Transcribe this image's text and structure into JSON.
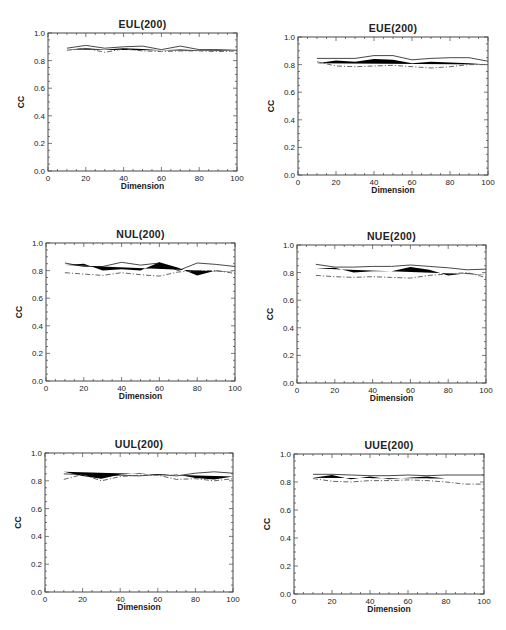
{
  "figure": {
    "panel_count": 6,
    "layout": "3 rows x 2 columns"
  },
  "chart_data": [
    {
      "type": "line",
      "title": "EUL(200)",
      "xlabel": "Dimension",
      "ylabel": "CC",
      "xlim": [
        0,
        100
      ],
      "ylim": [
        0.0,
        1.0
      ],
      "xticks": [
        "0",
        "20",
        "40",
        "60",
        "80",
        "100"
      ],
      "yticks": [
        "0.0",
        "0.2",
        "0.4",
        "0.6",
        "0.8",
        "1.0"
      ],
      "grid": false,
      "legend": null,
      "frame_px": {
        "x0": 48,
        "x1": 237,
        "y_top": 33,
        "y_bottom": 171
      },
      "x": [
        10,
        20,
        30,
        40,
        50,
        60,
        70,
        80,
        90,
        100
      ],
      "series": [
        {
          "name": "solid",
          "style": "solid",
          "values": [
            0.89,
            0.91,
            0.89,
            0.9,
            0.905,
            0.88,
            0.905,
            0.88,
            0.88,
            0.875
          ]
        },
        {
          "name": "dashed",
          "style": "dashed",
          "values": [
            0.88,
            0.89,
            0.88,
            0.89,
            0.885,
            0.875,
            0.88,
            0.875,
            0.875,
            0.87
          ]
        },
        {
          "name": "dash-dot",
          "style": "dashdot",
          "values": [
            0.875,
            0.89,
            0.86,
            0.885,
            0.87,
            0.865,
            0.87,
            0.87,
            0.865,
            0.87
          ]
        }
      ]
    },
    {
      "type": "line",
      "title": "EUE(200)",
      "xlabel": "Dimension",
      "ylabel": "CC",
      "xlim": [
        0,
        100
      ],
      "ylim": [
        0.0,
        1.0
      ],
      "xticks": [
        "0",
        "20",
        "40",
        "60",
        "80",
        "100"
      ],
      "yticks": [
        "0.0",
        "0.2",
        "0.4",
        "0.6",
        "0.8",
        "1.0"
      ],
      "grid": false,
      "legend": null,
      "frame_px": {
        "x0": 298,
        "x1": 488,
        "y_top": 37,
        "y_bottom": 175
      },
      "x": [
        10,
        20,
        30,
        40,
        50,
        60,
        70,
        80,
        90,
        100
      ],
      "series": [
        {
          "name": "solid",
          "style": "solid",
          "values": [
            0.845,
            0.845,
            0.845,
            0.865,
            0.865,
            0.835,
            0.845,
            0.85,
            0.85,
            0.825
          ]
        },
        {
          "name": "dashed",
          "style": "dashed",
          "values": [
            0.81,
            0.83,
            0.82,
            0.84,
            0.835,
            0.81,
            0.82,
            0.815,
            0.81,
            0.8
          ]
        },
        {
          "name": "dash-dot",
          "style": "dashdot",
          "values": [
            0.82,
            0.79,
            0.785,
            0.79,
            0.795,
            0.785,
            0.775,
            0.785,
            0.8,
            0.8
          ]
        }
      ]
    },
    {
      "type": "line",
      "title": "NUL(200)",
      "xlabel": "Dimension",
      "ylabel": "CC",
      "xlim": [
        0,
        100
      ],
      "ylim": [
        0.0,
        1.0
      ],
      "xticks": [
        "0",
        "20",
        "40",
        "60",
        "80",
        "100"
      ],
      "yticks": [
        "0.0",
        "0.2",
        "0.4",
        "0.6",
        "0.8",
        "1.0"
      ],
      "grid": false,
      "legend": null,
      "frame_px": {
        "x0": 46,
        "x1": 235,
        "y_top": 243,
        "y_bottom": 381
      },
      "x": [
        10,
        20,
        30,
        40,
        50,
        60,
        70,
        80,
        90,
        100
      ],
      "series": [
        {
          "name": "solid",
          "style": "solid",
          "values": [
            0.855,
            0.83,
            0.83,
            0.86,
            0.84,
            0.855,
            0.8,
            0.855,
            0.845,
            0.83
          ]
        },
        {
          "name": "dashed",
          "style": "dashed",
          "values": [
            0.84,
            0.85,
            0.8,
            0.81,
            0.8,
            0.86,
            0.82,
            0.765,
            0.8,
            0.79
          ]
        },
        {
          "name": "dash-dot",
          "style": "dashdot",
          "values": [
            0.785,
            0.775,
            0.765,
            0.785,
            0.77,
            0.76,
            0.79,
            0.8,
            0.8,
            0.78
          ]
        }
      ]
    },
    {
      "type": "line",
      "title": "NUE(200)",
      "xlabel": "Dimension",
      "ylabel": "CC",
      "xlim": [
        0,
        100
      ],
      "ylim": [
        0.0,
        1.0
      ],
      "xticks": [
        "0",
        "20",
        "40",
        "60",
        "80",
        "100"
      ],
      "yticks": [
        "0.0",
        "0.2",
        "0.4",
        "0.6",
        "0.8",
        "1.0"
      ],
      "grid": false,
      "legend": null,
      "frame_px": {
        "x0": 297,
        "x1": 486,
        "y_top": 245,
        "y_bottom": 383
      },
      "x": [
        10,
        20,
        30,
        40,
        50,
        60,
        70,
        80,
        90,
        100
      ],
      "series": [
        {
          "name": "solid",
          "style": "solid",
          "values": [
            0.86,
            0.84,
            0.84,
            0.845,
            0.845,
            0.855,
            0.845,
            0.835,
            0.82,
            0.825
          ]
        },
        {
          "name": "dashed",
          "style": "dashed",
          "values": [
            0.83,
            0.835,
            0.8,
            0.81,
            0.81,
            0.84,
            0.82,
            0.78,
            0.795,
            0.785
          ]
        },
        {
          "name": "dash-dot",
          "style": "dashdot",
          "values": [
            0.78,
            0.77,
            0.765,
            0.77,
            0.765,
            0.76,
            0.78,
            0.79,
            0.8,
            0.765
          ]
        }
      ]
    },
    {
      "type": "line",
      "title": "UUL(200)",
      "xlabel": "Dimension",
      "ylabel": "CC",
      "xlim": [
        0,
        100
      ],
      "ylim": [
        0.0,
        1.0
      ],
      "xticks": [
        "0",
        "20",
        "40",
        "60",
        "80",
        "100"
      ],
      "yticks": [
        "0.0",
        "0.2",
        "0.4",
        "0.6",
        "0.8",
        "1.0"
      ],
      "grid": false,
      "legend": null,
      "frame_px": {
        "x0": 45,
        "x1": 233,
        "y_top": 453,
        "y_bottom": 592
      },
      "x": [
        10,
        20,
        30,
        40,
        50,
        60,
        70,
        80,
        90,
        100
      ],
      "series": [
        {
          "name": "solid",
          "style": "solid",
          "values": [
            0.85,
            0.845,
            0.835,
            0.84,
            0.835,
            0.845,
            0.835,
            0.855,
            0.865,
            0.855
          ]
        },
        {
          "name": "dashed",
          "style": "dashed",
          "values": [
            0.865,
            0.835,
            0.815,
            0.845,
            0.855,
            0.84,
            0.845,
            0.82,
            0.81,
            0.83
          ]
        },
        {
          "name": "dash-dot",
          "style": "dashdot",
          "values": [
            0.81,
            0.845,
            0.8,
            0.83,
            0.84,
            0.84,
            0.81,
            0.815,
            0.8,
            0.815
          ]
        }
      ]
    },
    {
      "type": "line",
      "title": "UUE(200)",
      "xlabel": "Dimension",
      "ylabel": "CC",
      "xlim": [
        0,
        100
      ],
      "ylim": [
        0.0,
        1.0
      ],
      "xticks": [
        "0",
        "20",
        "40",
        "60",
        "80",
        "100"
      ],
      "yticks": [
        "0.0",
        "0.2",
        "0.4",
        "0.6",
        "0.8",
        "1.0"
      ],
      "grid": false,
      "legend": null,
      "frame_px": {
        "x0": 294,
        "x1": 484,
        "y_top": 454,
        "y_bottom": 594
      },
      "x": [
        10,
        20,
        30,
        40,
        50,
        60,
        70,
        80,
        90,
        100
      ],
      "series": [
        {
          "name": "solid",
          "style": "solid",
          "values": [
            0.855,
            0.855,
            0.85,
            0.845,
            0.845,
            0.85,
            0.845,
            0.85,
            0.85,
            0.85
          ]
        },
        {
          "name": "dashed",
          "style": "dashed",
          "values": [
            0.83,
            0.85,
            0.82,
            0.84,
            0.82,
            0.83,
            0.84,
            0.825,
            0.825,
            0.825
          ]
        },
        {
          "name": "dash-dot",
          "style": "dashdot",
          "values": [
            0.825,
            0.805,
            0.8,
            0.81,
            0.81,
            0.815,
            0.81,
            0.8,
            0.785,
            0.785
          ]
        }
      ]
    }
  ]
}
